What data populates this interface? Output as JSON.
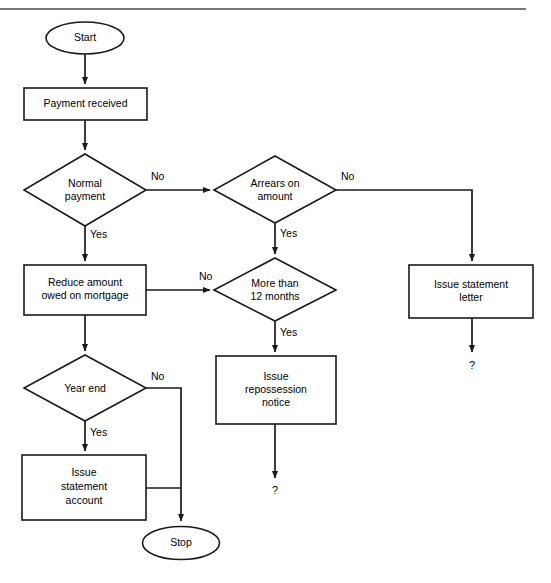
{
  "diagram": {
    "stroke_color": "#1a1a1a",
    "fill_color": "#ffffff",
    "rule_color": "#4a4a4a"
  },
  "nodes": {
    "start": {
      "label": "Start",
      "type": "terminator"
    },
    "payment_received": {
      "label": "Payment received",
      "type": "process"
    },
    "normal_payment": {
      "line1": "Normal",
      "line2": "payment",
      "type": "decision"
    },
    "arrears_on_amount": {
      "line1": "Arrears on",
      "line2": "amount",
      "type": "decision"
    },
    "reduce_amount": {
      "line1": "Reduce amount",
      "line2": "owed on mortgage",
      "type": "process"
    },
    "more_than_12_months": {
      "line1": "More than",
      "line2": "12 months",
      "type": "decision"
    },
    "issue_statement_letter": {
      "line1": "Issue statement",
      "line2": "letter",
      "type": "process"
    },
    "issue_repossession_notice": {
      "line1": "Issue",
      "line2": "repossession",
      "line3": "notice",
      "type": "process"
    },
    "year_end": {
      "label": "Year end",
      "type": "decision"
    },
    "issue_statement_account": {
      "line1": "Issue",
      "line2": "statement",
      "line3": "account",
      "type": "process"
    },
    "stop": {
      "label": "Stop",
      "type": "terminator"
    }
  },
  "edge_labels": {
    "normal_payment_no": "No",
    "normal_payment_yes": "Yes",
    "arrears_no": "No",
    "arrears_yes": "Yes",
    "reduce_no": "No",
    "more_than_12_yes": "Yes",
    "year_end_no": "No",
    "year_end_yes": "Yes"
  },
  "open_ends": {
    "repossession_continue": "?",
    "statement_letter_continue": "?"
  }
}
